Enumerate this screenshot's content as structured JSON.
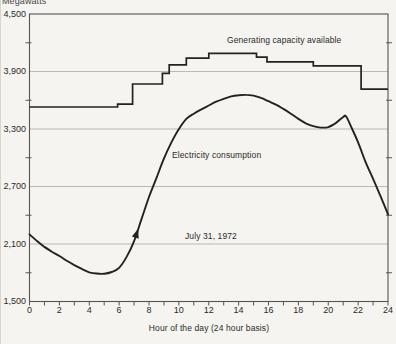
{
  "unit_label": "Megawatts",
  "x_axis_title": "Hour of the day (24 hour basis)",
  "colors": {
    "background": "#f5f4f1",
    "curve": "#232220",
    "grid": "#b3b2ad",
    "frame": "#56544f",
    "text": "#2c2b28"
  },
  "chart_data": {
    "type": "line",
    "title": "",
    "xlabel": "Hour of the day (24 hour basis)",
    "ylabel": "Megawatts",
    "xlim": [
      0,
      24
    ],
    "ylim": [
      1500,
      4500
    ],
    "grid": "horizontal-major",
    "legend": "inline-annotations",
    "x_ticks": [
      {
        "value": 0,
        "label": "0"
      },
      {
        "value": 2,
        "label": "2"
      },
      {
        "value": 4,
        "label": "4"
      },
      {
        "value": 6,
        "label": "6"
      },
      {
        "value": 8,
        "label": "8"
      },
      {
        "value": 10,
        "label": "10"
      },
      {
        "value": 12,
        "label": "12"
      },
      {
        "value": 14,
        "label": "14"
      },
      {
        "value": 16,
        "label": "16"
      },
      {
        "value": 18,
        "label": "18"
      },
      {
        "value": 20,
        "label": "20"
      },
      {
        "value": 22,
        "label": "22"
      },
      {
        "value": 24,
        "label": "24"
      }
    ],
    "x_minor_step": 1,
    "y_ticks": [
      {
        "value": 4500,
        "label": "4,500"
      },
      {
        "value": 3900,
        "label": "3,900"
      },
      {
        "value": 3300,
        "label": "3,300"
      },
      {
        "value": 2700,
        "label": "2,700"
      },
      {
        "value": 2100,
        "label": "2,100"
      },
      {
        "value": 1500,
        "label": "1,500"
      }
    ],
    "y_minor_values": [
      4200,
      3600,
      3000,
      2400,
      1800
    ],
    "y_gridline_values": [
      3900,
      3300,
      2700,
      2100
    ],
    "series": [
      {
        "name": "Generating capacity available",
        "style": "step",
        "points": [
          [
            0,
            3530
          ],
          [
            5.9,
            3530
          ],
          [
            5.9,
            3560
          ],
          [
            6.9,
            3560
          ],
          [
            6.9,
            3770
          ],
          [
            8.9,
            3770
          ],
          [
            8.9,
            3880
          ],
          [
            9.35,
            3880
          ],
          [
            9.35,
            3970
          ],
          [
            10.5,
            3970
          ],
          [
            10.5,
            4040
          ],
          [
            12,
            4040
          ],
          [
            12,
            4090
          ],
          [
            15.2,
            4090
          ],
          [
            15.2,
            4050
          ],
          [
            15.9,
            4050
          ],
          [
            15.9,
            4000
          ],
          [
            19,
            4000
          ],
          [
            19,
            3960
          ],
          [
            22.2,
            3960
          ],
          [
            22.2,
            3715
          ],
          [
            24,
            3715
          ]
        ]
      },
      {
        "name": "Electricity consumption",
        "style": "smooth",
        "points": [
          [
            0,
            2200
          ],
          [
            0.5,
            2130
          ],
          [
            1,
            2070
          ],
          [
            1.5,
            2020
          ],
          [
            2,
            1975
          ],
          [
            2.5,
            1925
          ],
          [
            3,
            1880
          ],
          [
            3.5,
            1840
          ],
          [
            4,
            1805
          ],
          [
            4.5,
            1792
          ],
          [
            5,
            1790
          ],
          [
            5.5,
            1808
          ],
          [
            6,
            1852
          ],
          [
            6.5,
            1965
          ],
          [
            7,
            2130
          ],
          [
            7.5,
            2360
          ],
          [
            8,
            2590
          ],
          [
            8.5,
            2790
          ],
          [
            9,
            2990
          ],
          [
            9.5,
            3160
          ],
          [
            10,
            3300
          ],
          [
            10.5,
            3405
          ],
          [
            11,
            3460
          ],
          [
            11.5,
            3505
          ],
          [
            12,
            3545
          ],
          [
            12.5,
            3585
          ],
          [
            13,
            3615
          ],
          [
            13.5,
            3640
          ],
          [
            14,
            3652
          ],
          [
            14.5,
            3656
          ],
          [
            15,
            3648
          ],
          [
            15.5,
            3625
          ],
          [
            16,
            3590
          ],
          [
            16.5,
            3555
          ],
          [
            17,
            3510
          ],
          [
            17.5,
            3460
          ],
          [
            18,
            3405
          ],
          [
            18.5,
            3360
          ],
          [
            19,
            3330
          ],
          [
            19.5,
            3315
          ],
          [
            20,
            3320
          ],
          [
            20.5,
            3362
          ],
          [
            21,
            3425
          ],
          [
            21.2,
            3430
          ],
          [
            21.6,
            3300
          ],
          [
            22,
            3160
          ],
          [
            22.5,
            2955
          ],
          [
            23,
            2780
          ],
          [
            23.5,
            2600
          ],
          [
            24,
            2410
          ]
        ]
      }
    ],
    "annotations": [
      {
        "text": "Generating capacity available",
        "h": 13.2,
        "v": 4185
      },
      {
        "text": "Electricity consumption",
        "h": 9.55,
        "v": 2985
      },
      {
        "text": "July 31, 1972",
        "h": 10.4,
        "v": 2145
      }
    ],
    "arrow_marker": {
      "series": "Electricity consumption",
      "h": 7.15
    }
  }
}
